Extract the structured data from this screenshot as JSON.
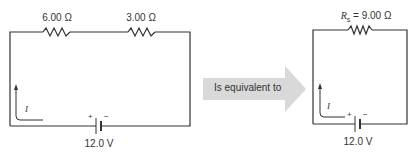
{
  "circuit_left": {
    "resistor_1_label": "6.00 Ω",
    "resistor_2_label": "3.00 Ω",
    "current_label": "I",
    "battery_plus": "+",
    "battery_minus": "−",
    "battery_label": "12.0 V"
  },
  "arrow": {
    "label": "Is equivalent to",
    "fill_color": "#d9d9d9"
  },
  "circuit_right": {
    "resistor_symbol": "R",
    "resistor_subscript": "s",
    "resistor_value": " = 9.00 Ω",
    "current_label": "I",
    "battery_plus": "+",
    "battery_minus": "−",
    "battery_label": "12.0 V"
  }
}
